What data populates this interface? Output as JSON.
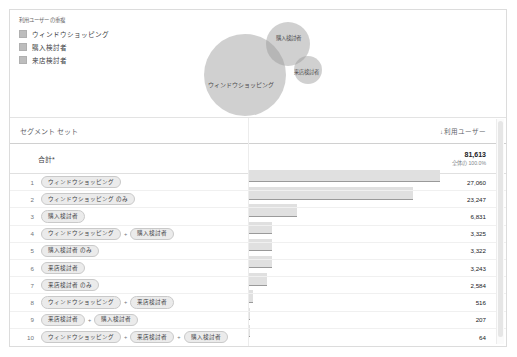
{
  "legend": {
    "title": "利用ユーザーの重複",
    "items": [
      {
        "label": "ウィンドウショッピング",
        "color": "#bdbdbd"
      },
      {
        "label": "購入検討者",
        "color": "#bdbdbd"
      },
      {
        "label": "来店検討者",
        "color": "#bdbdbd"
      }
    ]
  },
  "venn": {
    "labels": {
      "window_shopping": "ウィンドウショッピング",
      "purchase_intent": "購入検討者",
      "store_visit_intent": "来店検討者"
    }
  },
  "table": {
    "header": {
      "segment_set": "セグメント セット",
      "users": "利用ユーザー",
      "sort_arrow": "↓"
    },
    "total": {
      "label": "合計*",
      "value": "81,613",
      "percent": "全体の 100.0%"
    },
    "plus": "+",
    "rows": [
      {
        "index": "1",
        "chips": [
          "ウィンドウショッピング"
        ],
        "value": "27,060"
      },
      {
        "index": "2",
        "chips": [
          "ウィンドウショッピング のみ"
        ],
        "value": "23,247"
      },
      {
        "index": "3",
        "chips": [
          "購入検討者"
        ],
        "value": "6,831"
      },
      {
        "index": "4",
        "chips": [
          "ウィンドウショッピング",
          "購入検討者"
        ],
        "value": "3,325"
      },
      {
        "index": "5",
        "chips": [
          "購入検討者 のみ"
        ],
        "value": "3,322"
      },
      {
        "index": "6",
        "chips": [
          "来店検討者"
        ],
        "value": "3,243"
      },
      {
        "index": "7",
        "chips": [
          "来店検討者 のみ"
        ],
        "value": "2,584"
      },
      {
        "index": "8",
        "chips": [
          "ウィンドウショッピング",
          "来店検討者"
        ],
        "value": "516"
      },
      {
        "index": "9",
        "chips": [
          "来店検討者",
          "購入検討者"
        ],
        "value": "207"
      },
      {
        "index": "10",
        "chips": [
          "ウィンドウショッピング",
          "来店検討者",
          "購入検討者"
        ],
        "value": "64"
      }
    ]
  },
  "chart_data": {
    "type": "bar",
    "title": "利用ユーザーの重複",
    "xlabel": "",
    "ylabel": "利用ユーザー",
    "orientation": "horizontal",
    "categories": [
      "ウィンドウショッピング",
      "ウィンドウショッピング のみ",
      "購入検討者",
      "ウィンドウショッピング + 購入検討者",
      "購入検討者 のみ",
      "来店検討者",
      "来店検討者 のみ",
      "ウィンドウショッピング + 来店検討者",
      "来店検討者 + 購入検討者",
      "ウィンドウショッピング + 来店検討者 + 購入検討者"
    ],
    "values": [
      27060,
      23247,
      6831,
      3325,
      3322,
      3243,
      2584,
      516,
      207,
      64
    ],
    "total": 81613,
    "total_percent": "100.0%",
    "xlim": [
      0,
      27060
    ],
    "grid": false,
    "legend_position": "top-left",
    "legend_entries": [
      "ウィンドウショッピング",
      "購入検討者",
      "来店検討者"
    ],
    "venn": {
      "type": "venn3",
      "sets": [
        "ウィンドウショッピング",
        "購入検討者",
        "来店検討者"
      ],
      "set_totals": [
        27060,
        6831,
        3243
      ],
      "only": [
        23247,
        3322,
        2584
      ],
      "pairwise": {
        "ウィンドウショッピング+購入検討者": 3325,
        "ウィンドウショッピング+来店検討者": 516,
        "来店検討者+購入検討者": 207
      },
      "triple": 64
    }
  }
}
